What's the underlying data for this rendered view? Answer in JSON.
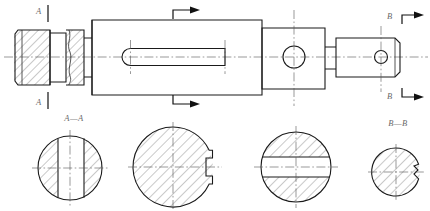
{
  "drawing": {
    "type": "mechanical-engineering-part-drawing",
    "subject": "stepped shaft with keyway, flats and cross holes",
    "background_color": "#ffffff",
    "line_color": "#1a1a1a",
    "hatch_color": "#3a3a3a",
    "centerline_color": "#555555",
    "label_color": "#6a6a6a",
    "canvas": {
      "width": 430,
      "height": 211
    }
  },
  "main_view": {
    "name": "front-elevation",
    "axis_y": 57,
    "segments": [
      {
        "id": "left-threaded-end",
        "x1": 14,
        "x2": 50,
        "top": 30,
        "bottom": 85,
        "hatched": true
      },
      {
        "id": "left-groove",
        "x1": 50,
        "x2": 66,
        "top": 33,
        "bottom": 82,
        "hatched": false
      },
      {
        "id": "left-collar",
        "x1": 66,
        "x2": 84,
        "top": 30,
        "bottom": 85,
        "hatched": true
      },
      {
        "id": "step-neck",
        "x1": 84,
        "x2": 92,
        "top": 38,
        "bottom": 77,
        "hatched": false
      },
      {
        "id": "main-body",
        "x1": 92,
        "x2": 262,
        "top": 20,
        "bottom": 95,
        "hatched": false
      },
      {
        "id": "square-block",
        "x1": 262,
        "x2": 325,
        "top": 28,
        "bottom": 89,
        "hatched": false
      },
      {
        "id": "block-neck",
        "x1": 325,
        "x2": 336,
        "top": 47,
        "bottom": 69,
        "hatched": false
      },
      {
        "id": "right-end",
        "x1": 336,
        "x2": 400,
        "top": 38,
        "bottom": 77,
        "hatched": false
      }
    ],
    "features": [
      {
        "id": "keyway-slot",
        "shape": "rounded-slot",
        "x1": 122,
        "x2": 225,
        "cy": 57,
        "height": 17
      },
      {
        "id": "large-cross-hole",
        "shape": "circle",
        "cx": 294,
        "cy": 57,
        "r": 11
      },
      {
        "id": "small-cross-hole",
        "shape": "circle",
        "cx": 381,
        "cy": 57,
        "r": 6.5
      }
    ]
  },
  "section_markers": [
    {
      "id": "marker-A-top",
      "label": "A",
      "label_x": 40,
      "label_y": 13,
      "line_x": 48,
      "direction": "down",
      "has_arrow": false
    },
    {
      "id": "marker-A-bottom",
      "label": "A",
      "label_x": 40,
      "label_y": 103,
      "line_x": 48,
      "direction": "up",
      "has_arrow": false
    },
    {
      "id": "marker-mid-top",
      "label": "",
      "corner_x": 173,
      "corner_y": 12,
      "arrow_to_x": 196,
      "direction": "right",
      "has_arrow": true
    },
    {
      "id": "marker-mid-bottom",
      "label": "",
      "corner_x": 173,
      "corner_y": 103,
      "arrow_to_x": 196,
      "direction": "right",
      "has_arrow": true
    },
    {
      "id": "marker-B-top",
      "label": "B",
      "label_x": 392,
      "label_y": 17,
      "corner_x": 403,
      "corner_y": 16,
      "arrow_to_x": 423,
      "direction": "right",
      "has_arrow": true
    },
    {
      "id": "marker-B-bottom",
      "label": "B",
      "label_x": 392,
      "label_y": 97,
      "corner_x": 403,
      "corner_y": 96,
      "arrow_to_x": 423,
      "direction": "right",
      "has_arrow": true
    }
  ],
  "vertical_centerlines": [
    {
      "id": "centerline-square-block",
      "x": 294,
      "y1": 10,
      "y2": 106
    },
    {
      "id": "centerline-right-end",
      "x": 381,
      "y1": 26,
      "y2": 92
    }
  ],
  "section_views": [
    {
      "id": "section-A-A",
      "title": "A—A",
      "title_x": 74,
      "title_y": 120,
      "cx": 70,
      "cy": 168,
      "r": 32,
      "feature": "two-opposed-flats-vertical-band",
      "band_left_x": 58,
      "band_right_x": 84,
      "hatched": true
    },
    {
      "id": "section-mid",
      "title": "",
      "cx": 173,
      "cy": 167,
      "r": 40,
      "feature": "right-side-stepped-notch",
      "hatched": true
    },
    {
      "id": "section-keyway",
      "title": "",
      "cx": 296,
      "cy": 167,
      "r": 35,
      "feature": "horizontal-through-slot",
      "band_top_y": 157,
      "band_bottom_y": 177,
      "hatched": true
    },
    {
      "id": "section-B-B",
      "title": "B—B",
      "title_x": 398,
      "title_y": 124,
      "cx": 396,
      "cy": 172,
      "r": 24,
      "feature": "right-side-small-notch",
      "hatched": true
    }
  ]
}
